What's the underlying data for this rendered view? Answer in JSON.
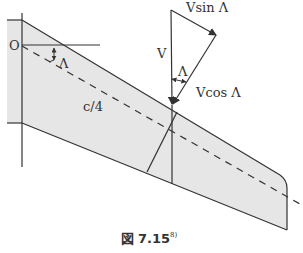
{
  "diagram": {
    "labels": {
      "origin": "O",
      "sweep_angle": "Λ",
      "quarter_chord": "c/4",
      "velocity": "V",
      "v_sin": "Vsin Λ",
      "v_cos": "Vcos Λ",
      "angle_at_vector": "Λ"
    },
    "caption": {
      "prefix": "図",
      "number": "7.15",
      "reference": "8)"
    },
    "colors": {
      "wing_fill": "#e6e6e6",
      "line": "#333333"
    }
  }
}
